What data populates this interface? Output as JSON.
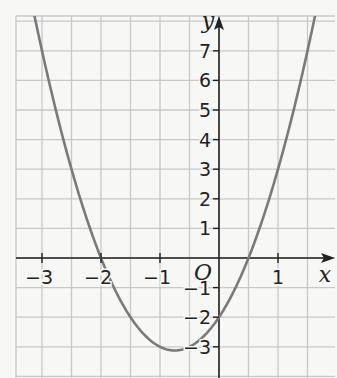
{
  "chart_data": {
    "type": "line",
    "title": "",
    "xlabel": "x",
    "ylabel": "y",
    "origin_label": "O",
    "function": "y = 2x^2 + 3x - 2",
    "xlim": [
      -3.4,
      1.95
    ],
    "ylim": [
      -4,
      8.1
    ],
    "grid": true,
    "x_ticks": [
      {
        "value": -3,
        "label": "−3"
      },
      {
        "value": -2,
        "label": "−2"
      },
      {
        "value": -1,
        "label": "−1"
      },
      {
        "value": 1,
        "label": "1"
      }
    ],
    "y_ticks": [
      {
        "value": 7,
        "label": "7"
      },
      {
        "value": 6,
        "label": "6"
      },
      {
        "value": 5,
        "label": "5"
      },
      {
        "value": 4,
        "label": "4"
      },
      {
        "value": 3,
        "label": "3"
      },
      {
        "value": 2,
        "label": "2"
      },
      {
        "value": 1,
        "label": "1"
      },
      {
        "value": -1,
        "label": "−1"
      },
      {
        "value": -2,
        "label": "−2"
      },
      {
        "value": -3,
        "label": "−3"
      }
    ],
    "series": [
      {
        "name": "parabola",
        "x": [
          -3.3,
          -3,
          -2.5,
          -2,
          -1.5,
          -1,
          -0.75,
          -0.5,
          0,
          0.5,
          1,
          1.5
        ],
        "y": [
          9.88,
          7,
          3,
          0,
          -2,
          -3,
          -3.125,
          -3,
          -2,
          0,
          3,
          7
        ]
      }
    ],
    "roots": [
      -2,
      0.5
    ],
    "y_intercept": -2,
    "vertex": [
      -0.75,
      -3.125
    ],
    "colors": {
      "curve": "#7a7a7a",
      "grid": "#c8c8c8",
      "axis": "#222222",
      "background": "#f7f7f6"
    }
  }
}
